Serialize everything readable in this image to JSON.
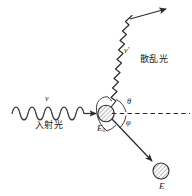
{
  "figure": {
    "name": "compton-scattering-diagram",
    "ink_color": "#2b2b2b",
    "label_color": "#1a1a1a",
    "hatch_color": "#555555"
  },
  "labels": {
    "incident_freq": "ν",
    "incident_light": "入射光",
    "scattered_freq": "ν′",
    "scattered_light": "散乱光",
    "target_energy": "E",
    "target_energy_sub": "0",
    "recoil_energy": "E",
    "angle_theta": "θ",
    "angle_phi": "φ"
  },
  "elements": {
    "target_particle": "hatched-circle-target",
    "recoil_particle": "hatched-circle-recoil",
    "reference_axis": "dashed-horizontal-axis",
    "incident_wave": "sine-wave-incoming",
    "scattered_wave": "zigzag-wave-outgoing",
    "recoil_arrow": "solid-arrow-down-right",
    "theta_arc": "arc-above-axis",
    "phi_arc": "arc-below-axis"
  }
}
